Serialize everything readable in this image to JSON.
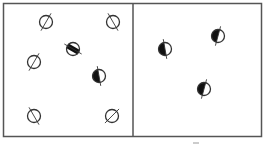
{
  "figure": {
    "stroke_color": "#333333",
    "fill_color": "#111111",
    "background": "#ffffff",
    "panels": [
      {
        "name": "left-chamber",
        "particles": [
          {
            "type": "open",
            "axis_angle": 60,
            "col": 0.35,
            "row": 0.15
          },
          {
            "type": "open",
            "axis_angle": 120,
            "col": 0.85,
            "row": 0.15
          },
          {
            "type": "striped",
            "axis_angle": 150,
            "col": 0.55,
            "row": 0.35
          },
          {
            "type": "open",
            "axis_angle": 60,
            "col": 0.25,
            "row": 0.45
          },
          {
            "type": "half-filled",
            "axis_angle": 100,
            "col": 0.75,
            "row": 0.55
          },
          {
            "type": "open",
            "axis_angle": 120,
            "col": 0.25,
            "row": 0.85
          },
          {
            "type": "slashed",
            "axis_angle": 45,
            "col": 0.85,
            "row": 0.85
          }
        ]
      },
      {
        "name": "right-chamber",
        "particles": [
          {
            "type": "half-filled",
            "axis_angle": 100,
            "col": 0.25,
            "row": 0.35
          },
          {
            "type": "half-filled",
            "axis_angle": 75,
            "col": 0.65,
            "row": 0.25
          },
          {
            "type": "half-filled",
            "axis_angle": 75,
            "col": 0.55,
            "row": 0.65
          }
        ]
      }
    ]
  }
}
